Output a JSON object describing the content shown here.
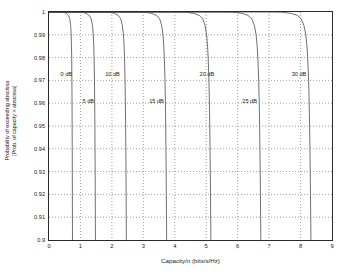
{
  "chart_data": {
    "type": "line",
    "title": "",
    "xlabel": "Capacity/n (bits/s/Hz)",
    "ylabel": "Probability of exceeding abscissa",
    "ylabel_line2": "[Prob. of capacity > abscissa]",
    "xlim": [
      0,
      9
    ],
    "ylim": [
      0.9,
      1.0
    ],
    "xticks": [
      0,
      1,
      2,
      3,
      4,
      5,
      6,
      7,
      8,
      9
    ],
    "xtick_labels": [
      "0",
      "1",
      "2",
      "3",
      "4",
      "5",
      "6",
      "7",
      "8",
      "9"
    ],
    "yticks": [
      0.9,
      0.91,
      0.92,
      0.93,
      0.94,
      0.95,
      0.96,
      0.97,
      0.98,
      0.99,
      1.0
    ],
    "ytick_labels": [
      "0.9",
      "0.91",
      "0.92",
      "0.93",
      "0.94",
      "0.95",
      "0.96",
      "0.97",
      "0.98",
      "0.99",
      "1"
    ],
    "grid": true,
    "grid_style": "dotted",
    "legend_position": "inline-annotations",
    "line_color": "#4d4d4d",
    "series": [
      {
        "name": "0 dB",
        "label": "0 dB",
        "label_x": 0.55,
        "label_y": 0.973,
        "points": [
          [
            0.0,
            1.0
          ],
          [
            0.3,
            1.0
          ],
          [
            0.45,
            0.9999
          ],
          [
            0.55,
            0.9994
          ],
          [
            0.62,
            0.9985
          ],
          [
            0.66,
            0.997
          ],
          [
            0.69,
            0.994
          ],
          [
            0.705,
            0.99
          ],
          [
            0.715,
            0.985
          ],
          [
            0.722,
            0.98
          ],
          [
            0.728,
            0.97
          ],
          [
            0.733,
            0.96
          ],
          [
            0.736,
            0.95
          ],
          [
            0.739,
            0.94
          ],
          [
            0.741,
            0.93
          ],
          [
            0.743,
            0.92
          ],
          [
            0.745,
            0.91
          ],
          [
            0.747,
            0.9
          ]
        ]
      },
      {
        "name": "5 dB",
        "label": "5 dB",
        "label_x": 1.25,
        "label_y": 0.961,
        "points": [
          [
            0.0,
            1.0
          ],
          [
            0.85,
            1.0
          ],
          [
            1.05,
            0.9999
          ],
          [
            1.18,
            0.9994
          ],
          [
            1.28,
            0.9985
          ],
          [
            1.34,
            0.997
          ],
          [
            1.385,
            0.994
          ],
          [
            1.408,
            0.99
          ],
          [
            1.424,
            0.985
          ],
          [
            1.434,
            0.98
          ],
          [
            1.446,
            0.97
          ],
          [
            1.453,
            0.96
          ],
          [
            1.459,
            0.95
          ],
          [
            1.464,
            0.94
          ],
          [
            1.468,
            0.93
          ],
          [
            1.471,
            0.92
          ],
          [
            1.474,
            0.91
          ],
          [
            1.477,
            0.9
          ]
        ]
      },
      {
        "name": "10 dB",
        "label": "10 dB",
        "label_x": 2.02,
        "label_y": 0.973,
        "points": [
          [
            0.0,
            1.0
          ],
          [
            1.65,
            1.0
          ],
          [
            1.92,
            0.9999
          ],
          [
            2.08,
            0.9994
          ],
          [
            2.2,
            0.9985
          ],
          [
            2.28,
            0.997
          ],
          [
            2.335,
            0.994
          ],
          [
            2.367,
            0.99
          ],
          [
            2.388,
            0.985
          ],
          [
            2.402,
            0.98
          ],
          [
            2.419,
            0.97
          ],
          [
            2.429,
            0.96
          ],
          [
            2.437,
            0.95
          ],
          [
            2.443,
            0.94
          ],
          [
            2.449,
            0.93
          ],
          [
            2.453,
            0.92
          ],
          [
            2.457,
            0.91
          ],
          [
            2.461,
            0.9
          ]
        ]
      },
      {
        "name": "15 dB",
        "label": "15 dB",
        "label_x": 3.42,
        "label_y": 0.961,
        "points": [
          [
            0.0,
            1.0
          ],
          [
            2.75,
            1.0
          ],
          [
            3.05,
            0.9999
          ],
          [
            3.26,
            0.9994
          ],
          [
            3.42,
            0.9985
          ],
          [
            3.52,
            0.997
          ],
          [
            3.585,
            0.994
          ],
          [
            3.625,
            0.99
          ],
          [
            3.651,
            0.985
          ],
          [
            3.668,
            0.98
          ],
          [
            3.689,
            0.97
          ],
          [
            3.702,
            0.96
          ],
          [
            3.711,
            0.95
          ],
          [
            3.719,
            0.94
          ],
          [
            3.726,
            0.93
          ],
          [
            3.731,
            0.92
          ],
          [
            3.736,
            0.91
          ],
          [
            3.741,
            0.9
          ]
        ]
      },
      {
        "name": "20 dB",
        "label": "20 dB",
        "label_x": 5.02,
        "label_y": 0.973,
        "points": [
          [
            0.0,
            1.0
          ],
          [
            4.0,
            1.0
          ],
          [
            4.36,
            0.9999
          ],
          [
            4.6,
            0.9994
          ],
          [
            4.78,
            0.9985
          ],
          [
            4.89,
            0.997
          ],
          [
            4.965,
            0.994
          ],
          [
            5.012,
            0.99
          ],
          [
            5.043,
            0.985
          ],
          [
            5.062,
            0.98
          ],
          [
            5.087,
            0.97
          ],
          [
            5.102,
            0.96
          ],
          [
            5.113,
            0.95
          ],
          [
            5.122,
            0.94
          ],
          [
            5.13,
            0.93
          ],
          [
            5.136,
            0.92
          ],
          [
            5.142,
            0.91
          ],
          [
            5.148,
            0.9
          ]
        ]
      },
      {
        "name": "25 dB",
        "label": "25 dB",
        "label_x": 6.38,
        "label_y": 0.961,
        "points": [
          [
            0.0,
            1.0
          ],
          [
            5.45,
            1.0
          ],
          [
            5.86,
            0.9999
          ],
          [
            6.13,
            0.9994
          ],
          [
            6.33,
            0.9985
          ],
          [
            6.45,
            0.997
          ],
          [
            6.534,
            0.994
          ],
          [
            6.586,
            0.99
          ],
          [
            6.62,
            0.985
          ],
          [
            6.641,
            0.98
          ],
          [
            6.669,
            0.97
          ],
          [
            6.686,
            0.96
          ],
          [
            6.698,
            0.95
          ],
          [
            6.708,
            0.94
          ],
          [
            6.717,
            0.93
          ],
          [
            6.724,
            0.92
          ],
          [
            6.73,
            0.91
          ],
          [
            6.737,
            0.9
          ]
        ]
      },
      {
        "name": "30 dB",
        "label": "30 dB",
        "label_x": 7.95,
        "label_y": 0.973,
        "points": [
          [
            0.0,
            1.0
          ],
          [
            6.95,
            1.0
          ],
          [
            7.4,
            0.9999
          ],
          [
            7.7,
            0.9994
          ],
          [
            7.9,
            0.9985
          ],
          [
            8.02,
            0.997
          ],
          [
            8.11,
            0.994
          ],
          [
            8.166,
            0.99
          ],
          [
            8.203,
            0.985
          ],
          [
            8.226,
            0.98
          ],
          [
            8.256,
            0.97
          ],
          [
            8.275,
            0.96
          ],
          [
            8.288,
            0.95
          ],
          [
            8.299,
            0.94
          ],
          [
            8.308,
            0.93
          ],
          [
            8.316,
            0.92
          ],
          [
            8.323,
            0.91
          ],
          [
            8.33,
            0.9
          ]
        ]
      }
    ]
  }
}
